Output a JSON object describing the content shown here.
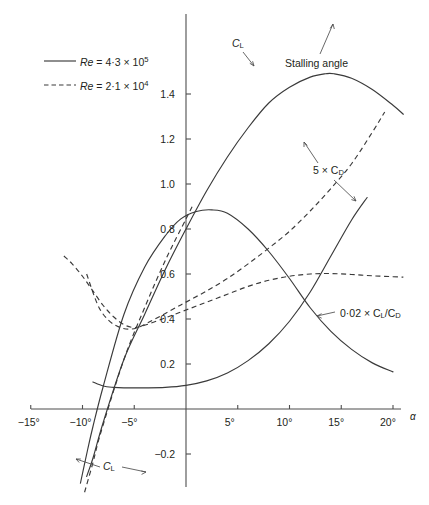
{
  "figure": {
    "kind": "aerofoil-characteristics",
    "background_color": "#ffffff",
    "ink_color": "#231f20",
    "axis_color": "#4d4d4d"
  },
  "legend": {
    "entries": [
      {
        "style": "solid",
        "prefix": "Re",
        "eq": " = 4·3 × 10",
        "exp": "5"
      },
      {
        "style": "dashed",
        "prefix": "Re",
        "eq": " = 2·1 × 10",
        "exp": "4"
      }
    ]
  },
  "axes": {
    "x": {
      "label": "α",
      "unit": "°",
      "ticks": [
        "−15°",
        "−10°",
        "−5°",
        "5°",
        "10°",
        "15°",
        "20°"
      ],
      "tick_values": [
        -15,
        -10,
        -5,
        5,
        10,
        15,
        20
      ],
      "range": [
        -16.5,
        21.5
      ]
    },
    "y": {
      "ticks": [
        "1.4",
        "1.2",
        "1.0",
        "0.8",
        "0.6",
        "0.4",
        "0.2",
        "−0.2"
      ],
      "tick_values": [
        1.4,
        1.2,
        1.0,
        0.8,
        0.6,
        0.4,
        0.2,
        -0.2
      ],
      "range": [
        -0.33,
        1.58
      ]
    },
    "grid": "none"
  },
  "annotations": [
    {
      "name": "cl-top",
      "text": "C",
      "sub": "L",
      "x": 237,
      "y": 44
    },
    {
      "name": "stalling-angle",
      "text": "Stalling angle",
      "x": 290,
      "y": 64
    },
    {
      "name": "five-cd",
      "text": "5 × C",
      "sub": "D",
      "x": 316,
      "y": 170
    },
    {
      "name": "cl-over-cd",
      "text": "0·02 × C",
      "sub": "L",
      "text2": "/C",
      "sub2": "D",
      "x": 340,
      "y": 313
    },
    {
      "name": "cl-bottom",
      "text": "C",
      "sub": "L",
      "x": 105,
      "y": 466
    }
  ],
  "chart_data": {
    "type": "line",
    "title": "",
    "xlabel": "α",
    "ylabel": "",
    "xlim": [
      -16.5,
      21.5
    ],
    "ylim": [
      -0.33,
      1.58
    ],
    "grid": false,
    "legend_position": "upper-left",
    "series": [
      {
        "name": "C_L  (Re = 4·3 × 10⁵)",
        "style": "solid",
        "quantity": "C_L",
        "reynolds": "4.3e5",
        "comment": "lift coefficient, high Re: near-linear rise from about −8.6° through 0.80 at 0°, stall peak 1.49 at 14.3°, then falls",
        "x": [
          -9.6,
          -9.0,
          -8.0,
          -6.0,
          -4.0,
          -2.0,
          0.0,
          2.0,
          4.0,
          6.0,
          8.0,
          10.0,
          12.0,
          13.5,
          14.3,
          16.0,
          18.0,
          20.0,
          21.0
        ],
        "y": [
          -0.3,
          -0.22,
          -0.06,
          0.22,
          0.42,
          0.62,
          0.8,
          0.97,
          1.12,
          1.25,
          1.36,
          1.43,
          1.475,
          1.49,
          1.49,
          1.47,
          1.42,
          1.35,
          1.31
        ]
      },
      {
        "name": "C_L  (Re = 2·1 × 10⁴)",
        "style": "dashed",
        "quantity": "C_L",
        "reynolds": "2.1e4",
        "comment": "lift coefficient, low Re: steeper-looking straight branch crossing zero near −8.2°, reaching 0.84 at 0° and continuing",
        "x": [
          -9.8,
          -9.0,
          -8.2,
          -6.0,
          -4.0,
          -2.0,
          0.0,
          0.6
        ],
        "y": [
          -0.37,
          -0.24,
          -0.1,
          0.22,
          0.45,
          0.66,
          0.845,
          0.9
        ]
      },
      {
        "name": "5 × C_D  (Re = 4·3 × 10⁵)",
        "style": "solid",
        "quantity": "5 x C_D",
        "reynolds": "4.3e5",
        "comment": "drag: shallow bucket, minimum about 0.095 near −6° to −3°, rising steeply after 5°",
        "x": [
          -9.0,
          -8.0,
          -7.0,
          -6.0,
          -4.0,
          -2.0,
          0.0,
          2.0,
          4.0,
          6.0,
          8.0,
          10.0,
          12.0,
          14.0,
          16.0,
          17.5
        ],
        "y": [
          0.12,
          0.102,
          0.096,
          0.094,
          0.094,
          0.096,
          0.105,
          0.125,
          0.16,
          0.215,
          0.29,
          0.39,
          0.52,
          0.68,
          0.84,
          0.94
        ]
      },
      {
        "name": "5 × C_D  (Re = 2·1 × 10⁴)",
        "style": "dashed",
        "quantity": "5 x C_D",
        "reynolds": "2.1e4",
        "comment": "drag at low Re: much higher, dips to about 0.355 near −5.5° then rises steadily to 1.33 at 19°",
        "x": [
          -9.6,
          -8.5,
          -7.5,
          -6.5,
          -5.5,
          -4.5,
          -3.0,
          -1.0,
          0.0,
          2.0,
          4.0,
          6.0,
          8.0,
          10.0,
          12.0,
          14.0,
          16.0,
          18.0,
          19.2
        ],
        "y": [
          0.6,
          0.46,
          0.395,
          0.365,
          0.355,
          0.365,
          0.4,
          0.45,
          0.475,
          0.525,
          0.58,
          0.645,
          0.715,
          0.79,
          0.88,
          0.98,
          1.09,
          1.23,
          1.32
        ]
      },
      {
        "name": "0·02 × C_L/C_D  (Re = 4·3 × 10⁵)",
        "style": "solid",
        "quantity": "0.02 x C_L/C_D",
        "reynolds": "4.3e5",
        "comment": "efficiency, high Re: rises from the zero-lift angle to a maximum 0.885 at about 2.5°, then decays to 0.16 at 20°",
        "x": [
          -10.2,
          -9.5,
          -9.0,
          -8.0,
          -6.0,
          -4.0,
          -2.0,
          -0.5,
          1.0,
          2.5,
          4.0,
          6.0,
          8.0,
          10.0,
          12.0,
          14.0,
          16.0,
          18.0,
          20.0
        ],
        "y": [
          -0.33,
          -0.18,
          -0.08,
          0.1,
          0.42,
          0.63,
          0.77,
          0.845,
          0.878,
          0.885,
          0.87,
          0.8,
          0.7,
          0.58,
          0.45,
          0.345,
          0.265,
          0.205,
          0.165
        ]
      },
      {
        "name": "0·02 × C_L/C_D  (Re = 2·1 × 10⁴)",
        "style": "dashed",
        "quantity": "0.02 x C_L/C_D",
        "reynolds": "2.1e4",
        "comment": "efficiency, low Re: falls from 0.68 at −11.8° to a minimum near −5°, rises to a flat maximum 0.60 about 13°, then slight fall",
        "x": [
          -11.8,
          -11.0,
          -10.0,
          -9.0,
          -8.0,
          -7.0,
          -6.0,
          -5.0,
          -4.0,
          -2.0,
          0.0,
          2.0,
          4.0,
          6.0,
          8.0,
          10.0,
          12.0,
          14.0,
          16.0,
          18.0,
          20.0,
          21.0
        ],
        "y": [
          0.68,
          0.645,
          0.59,
          0.525,
          0.46,
          0.41,
          0.375,
          0.362,
          0.372,
          0.405,
          0.44,
          0.475,
          0.51,
          0.545,
          0.572,
          0.59,
          0.6,
          0.602,
          0.598,
          0.592,
          0.588,
          0.586
        ]
      }
    ],
    "markers": {
      "stalling_angle": {
        "x": 14.3,
        "y": 1.49,
        "label": "Stalling angle"
      }
    }
  }
}
